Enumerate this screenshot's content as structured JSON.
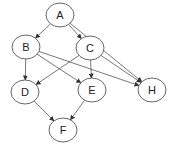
{
  "diagram": {
    "type": "directed-graph",
    "nodes": [
      {
        "id": "A",
        "label": "A",
        "x": 60,
        "y": 15
      },
      {
        "id": "B",
        "label": "B",
        "x": 26,
        "y": 47
      },
      {
        "id": "C",
        "label": "C",
        "x": 90,
        "y": 48
      },
      {
        "id": "D",
        "label": "D",
        "x": 25,
        "y": 92
      },
      {
        "id": "E",
        "label": "E",
        "x": 92,
        "y": 90
      },
      {
        "id": "H",
        "label": "H",
        "x": 152,
        "y": 90
      },
      {
        "id": "F",
        "label": "F",
        "x": 63,
        "y": 130
      }
    ],
    "edges": [
      {
        "from": "A",
        "to": "B"
      },
      {
        "from": "A",
        "to": "C"
      },
      {
        "from": "A",
        "to": "H"
      },
      {
        "from": "B",
        "to": "D"
      },
      {
        "from": "B",
        "to": "E"
      },
      {
        "from": "B",
        "to": "H"
      },
      {
        "from": "C",
        "to": "D"
      },
      {
        "from": "C",
        "to": "E"
      },
      {
        "from": "C",
        "to": "H"
      },
      {
        "from": "D",
        "to": "F"
      },
      {
        "from": "E",
        "to": "F"
      }
    ]
  }
}
